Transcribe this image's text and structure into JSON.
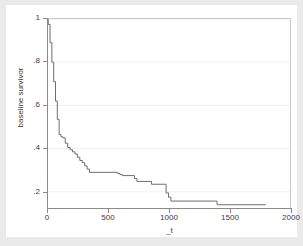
{
  "chart_data": {
    "type": "line",
    "title": "",
    "subtitle": "",
    "xlabel": "_t",
    "ylabel": "baseline survivor",
    "xlim": [
      0,
      2000
    ],
    "ylim": [
      0.125,
      1.0
    ],
    "xticks": [
      0,
      500,
      1000,
      1500,
      2000
    ],
    "xtick_labels": [
      "0",
      "500",
      "1000",
      "1500",
      "2000"
    ],
    "yticks": [
      0.2,
      0.4,
      0.6,
      0.8,
      1.0
    ],
    "ytick_labels": [
      ".2",
      ".4",
      ".6",
      ".8",
      "1"
    ],
    "grid": "horizontal",
    "legend": "none",
    "line_color": "#6e6e6e",
    "series": [
      {
        "name": "baseline survivor",
        "step": "post",
        "x": [
          0,
          10,
          25,
          40,
          55,
          70,
          85,
          100,
          115,
          130,
          150,
          170,
          190,
          210,
          230,
          250,
          270,
          290,
          310,
          330,
          350,
          560,
          580,
          600,
          620,
          700,
          720,
          740,
          840,
          860,
          960,
          980,
          1000,
          1020,
          1380,
          1400,
          1800
        ],
        "y": [
          1.0,
          0.975,
          0.89,
          0.8,
          0.71,
          0.62,
          0.535,
          0.465,
          0.455,
          0.45,
          0.425,
          0.405,
          0.395,
          0.385,
          0.375,
          0.36,
          0.345,
          0.335,
          0.32,
          0.305,
          0.29,
          0.29,
          0.285,
          0.28,
          0.275,
          0.275,
          0.262,
          0.248,
          0.248,
          0.235,
          0.235,
          0.195,
          0.175,
          0.157,
          0.157,
          0.14,
          0.14
        ]
      }
    ]
  },
  "axes": {
    "x_title": "_t",
    "y_title": "baseline survivor",
    "x_labels": [
      "0",
      "500",
      "1000",
      "1500",
      "2000"
    ],
    "y_labels": [
      "1",
      ".8",
      ".6",
      ".4",
      ".2"
    ]
  }
}
